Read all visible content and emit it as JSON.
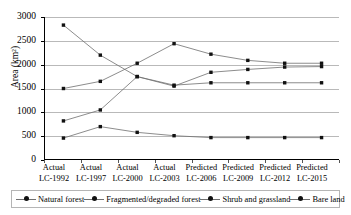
{
  "chart_data": {
    "type": "line",
    "title": "",
    "xlabel": "",
    "ylabel": "Area (km²)",
    "ylim": [
      0,
      3000
    ],
    "yticks": [
      0,
      500,
      1000,
      1500,
      2000,
      2500,
      3000
    ],
    "ytick_labels": [
      "0",
      "500",
      "1000",
      "1500",
      "2000",
      "2500",
      "3000"
    ],
    "grid": true,
    "legend_position": "bottom",
    "categories": [
      "Actual LC-1992",
      "Actual LC-1997",
      "Actual LC-2000",
      "Actual LC-2003",
      "Predicted LC-2006",
      "Predicted LC-2009",
      "Predicted LC-2012",
      "Predicted LC-2015"
    ],
    "category_lines": [
      [
        "Actual",
        "LC-1992"
      ],
      [
        "Actual",
        "LC-1997"
      ],
      [
        "Actual",
        "LC-2000"
      ],
      [
        "Actual",
        "LC-2003"
      ],
      [
        "Predicted",
        "LC-2006"
      ],
      [
        "Predicted",
        "LC-2009"
      ],
      [
        "Predicted",
        "LC-2012"
      ],
      [
        "Predicted",
        "LC-2015"
      ]
    ],
    "series": [
      {
        "name": "Natural forest",
        "marker": "filled-square",
        "values": [
          2830,
          2200,
          1750,
          1570,
          1620,
          1620,
          1620,
          1620
        ]
      },
      {
        "name": "Fragmented/degraded forest",
        "marker": "filled-square",
        "values": [
          1500,
          1650,
          2030,
          2440,
          2220,
          2090,
          2030,
          2030
        ]
      },
      {
        "name": "Shrub and grassland",
        "marker": "filled-square",
        "values": [
          820,
          1050,
          1750,
          1550,
          1840,
          1900,
          1950,
          1960
        ]
      },
      {
        "name": "Bare land",
        "marker": "filled-square",
        "values": [
          460,
          700,
          580,
          510,
          470,
          470,
          470,
          470
        ]
      }
    ],
    "colors": {
      "line": "#6f6f6f",
      "marker": "#111111",
      "gridline": "#b9b9b9",
      "axis": "#000000",
      "background": "#ffffff"
    }
  },
  "legend": {
    "items": [
      "Natural forest",
      "Fragmented/degraded forest",
      "Shrub and grassland",
      "Bare land"
    ]
  }
}
